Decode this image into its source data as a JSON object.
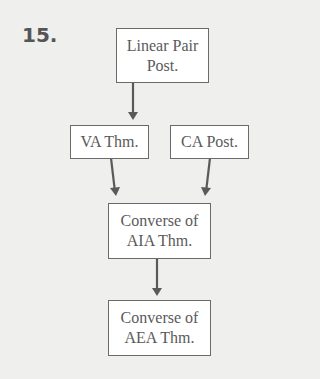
{
  "problem_number": "15.",
  "nodes": [
    {
      "id": "linear-pair",
      "lines": [
        "Linear Pair",
        "Post."
      ]
    },
    {
      "id": "va-thm",
      "lines": [
        "VA Thm."
      ]
    },
    {
      "id": "ca-post",
      "lines": [
        "CA Post."
      ]
    },
    {
      "id": "converse-aia",
      "lines": [
        "Converse of",
        "AIA Thm."
      ]
    },
    {
      "id": "converse-aea",
      "lines": [
        "Converse of",
        "AEA Thm."
      ]
    }
  ],
  "edges": [
    {
      "from": "linear-pair",
      "to": "va-thm"
    },
    {
      "from": "va-thm",
      "to": "converse-aia"
    },
    {
      "from": "ca-post",
      "to": "converse-aia"
    },
    {
      "from": "converse-aia",
      "to": "converse-aea"
    }
  ]
}
